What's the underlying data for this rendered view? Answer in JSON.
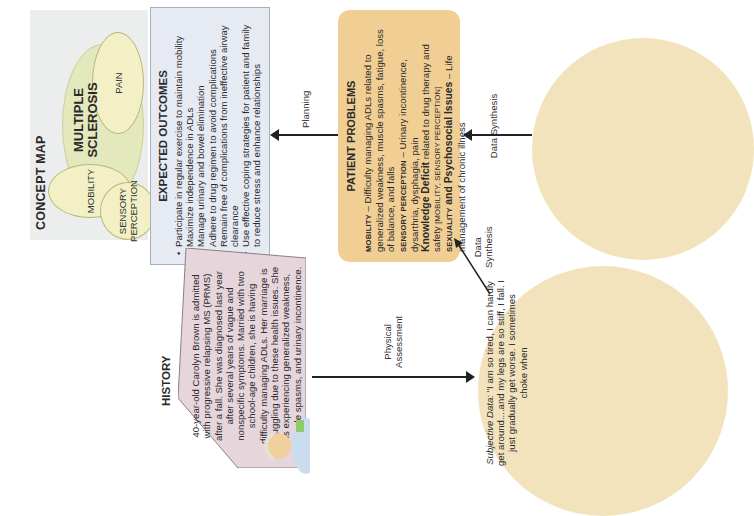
{
  "concept_map": {
    "title": "CONCEPT MAP",
    "center": "MULTIPLE SCLEROSIS",
    "center_line1": "MULTIPLE",
    "center_line2": "SCLEROSIS",
    "nodes": [
      "MOBILITY",
      "PAIN",
      "SENSORY PERCEPTION"
    ],
    "node_sensory_line1": "SENSORY",
    "node_sensory_line2": "PERCEPTION"
  },
  "expected_outcomes": {
    "title": "EXPECTED OUTCOMES",
    "items": [
      "Participate in regular exercise to maintain mobility",
      "Maximize independence in ADLs",
      "Manage urinary and bowel elimination",
      "Adhere to drug regimen to avoid complications",
      "Remain free of complications from ineffective airway clearance",
      "Use effective coping strategies for patient and family to reduce stress and enhance relationships"
    ]
  },
  "patient_problems": {
    "title": "PATIENT PROBLEMS",
    "mobility_label": "MOBILITY",
    "mobility_text": " – Difficulty managing ADLs related to generalized weakness, muscle spasms, fatigue, loss of balance, and falls",
    "sensory_label": "SENSORY PERCEPTION",
    "sensory_text": " – Urinary incontinence, dysarthria, dysphagia, pain",
    "knowledge_label": "Knowledge Deficit",
    "knowledge_text": " related to drug therapy and safety ",
    "knowledge_tags": "[MOBILITY, SENSORY PERCEPTION]",
    "sexuality_label": "SEXUALITY",
    "sexuality_mid": " and Psychosocial Issues",
    "sexuality_text": " – Life management of chronic illness"
  },
  "history": {
    "title": "HISTORY",
    "text": "40-year-old Carolyn Brown is admitted with progressive relapsing MS (PRMS) after a fall. She was diagnosed last year after several years of vague and nonspecific symptoms. Married with two school-age children, she is having difficulty managing ADLs. Her marriage is struggling due to these health issues. She is experiencing generalized weakness, muscle spasms, and urinary incontinence."
  },
  "subjective_data": {
    "label": "Subjective Data:",
    "text": " \"I am so tired, I can hardly get around....and my legs are so stiff, I fall. I just gradually get worse. I sometimes choke when"
  },
  "arrows": {
    "planning": "Planning",
    "physical_assessment_1": "Physical",
    "physical_assessment_2": "Assessment",
    "data_synthesis": "Data Synthesis",
    "data_synthesis_1": "Data",
    "data_synthesis_2": "Synthesis"
  },
  "colors": {
    "concept_panel": "#eceeee",
    "node_fill": "#f3f0c6",
    "outcomes_fill": "#e6eaf2",
    "problems_fill": "#f1cf94",
    "history_fill": "#e6d6dc",
    "data_circle_fill": "#f3e3bd"
  }
}
